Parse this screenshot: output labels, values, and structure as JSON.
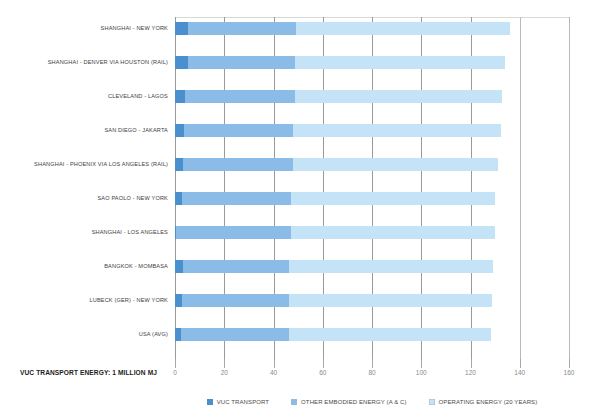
{
  "chart_data": {
    "type": "bar",
    "orientation": "horizontal",
    "stacked": true,
    "title": "",
    "subtitle": "",
    "xlabel": "",
    "ylabel": "VUC TRANSPORT ENERGY: 1 MILLION MJ",
    "xlim": [
      0,
      160
    ],
    "xticks": [
      0,
      20,
      40,
      60,
      80,
      100,
      120,
      140,
      160
    ],
    "xtick_labels": [
      "0",
      "20",
      "40",
      "60",
      "80",
      "100",
      "120",
      "140",
      "160"
    ],
    "grid": true,
    "grid_axis": "x",
    "legend_position": "bottom-center",
    "categories": [
      "SHANGHAI - NEW YORK",
      "SHANGHAI - DENVER VIA HOUSTON (RAIL)",
      "CLEVELAND - LAGOS",
      "SAN DIEGO - JAKARTA",
      "SHANGHAI - PHOENIX VIA LOS ANGELES (RAIL)",
      "SAO PAOLO - NEW YORK",
      "SHANGHAI - LOS ANGELES",
      "BANGKOK - MOMBASA",
      "LUBECK (GER) - NEW YORK",
      "USA (AVG)"
    ],
    "series": [
      {
        "name": "VUC TRANSPORT",
        "color": "#4a90cf",
        "values": [
          5.3,
          5.1,
          4.0,
          3.6,
          3.4,
          2.9,
          0.6,
          3.2,
          3.0,
          2.6
        ]
      },
      {
        "name": "OTHER EMBODIED ENERGY (A & C)",
        "color": "#8bbce8",
        "values": [
          43.9,
          43.7,
          44.7,
          44.5,
          44.4,
          44.1,
          46.4,
          42.9,
          43.1,
          43.5
        ]
      },
      {
        "name": "OPERATING ENERGY (20 YEARS)",
        "color": "#c5e3f7",
        "values": [
          86.8,
          85.2,
          84.3,
          84.1,
          83.2,
          83.0,
          83.0,
          82.9,
          82.6,
          82.3
        ]
      }
    ],
    "totals": [
      136.0,
      134.0,
      133.0,
      132.2,
      131.0,
      130.0,
      130.0,
      129.0,
      128.7,
      128.4
    ]
  },
  "legend": {
    "items": [
      {
        "label": "VUC TRANSPORT",
        "color": "#4a90cf"
      },
      {
        "label": "OTHER EMBODIED ENERGY (A & C)",
        "color": "#8bbce8"
      },
      {
        "label": "OPERATING ENERGY (20 YEARS)",
        "color": "#c5e3f7"
      }
    ]
  },
  "colors": {
    "vuc_transport": "#4a90cf",
    "other_embodied": "#8bbce8",
    "operating": "#c5e3f7",
    "gridline": "#9a9a9a",
    "tick_label": "#8a8a8a",
    "category_label": "#3d3d3d",
    "axis_title": "#1c1c1c",
    "background": "#ffffff"
  }
}
